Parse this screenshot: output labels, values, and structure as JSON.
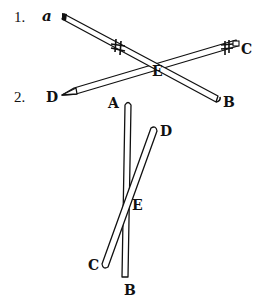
{
  "figures": [
    {
      "number": "1.",
      "labels": {
        "a": "a",
        "b": "B",
        "c": "C",
        "d": "D",
        "e": "E"
      },
      "rods": [
        {
          "name": "rod-ab",
          "from": "a",
          "to": "B"
        },
        {
          "name": "rod-dc",
          "from": "D",
          "to": "C"
        }
      ],
      "marks": [
        "#",
        "#"
      ]
    },
    {
      "number": "2.",
      "labels": {
        "a": "A",
        "b": "B",
        "c": "C",
        "d": "D",
        "e": "E"
      },
      "rods": [
        {
          "name": "rod-ab",
          "from": "A",
          "to": "B"
        },
        {
          "name": "rod-cd",
          "from": "C",
          "to": "D"
        }
      ]
    }
  ],
  "colors": {
    "ink": "#111111",
    "paper": "#ffffff"
  }
}
